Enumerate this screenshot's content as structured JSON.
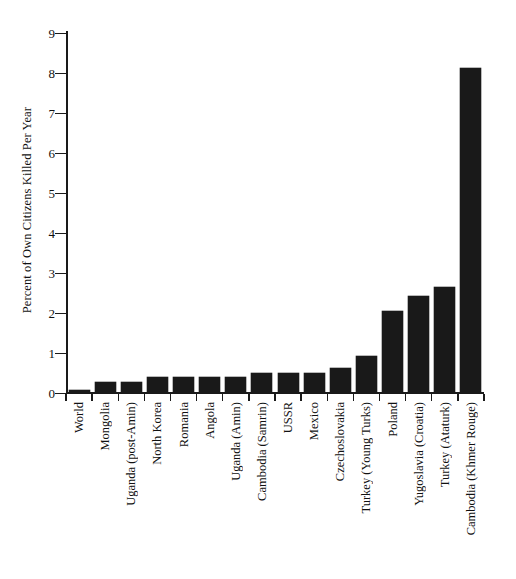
{
  "chart_data": {
    "type": "bar",
    "title": "",
    "xlabel": "",
    "ylabel": "Percent of Own Citizens Killed Per Year",
    "ylim": [
      0,
      9
    ],
    "ytick_labels": [
      "0",
      "1",
      "2",
      "3",
      "4",
      "5",
      "6",
      "7",
      "8",
      "9"
    ],
    "ytick_values": [
      0,
      1,
      2,
      3,
      4,
      5,
      6,
      7,
      8,
      9
    ],
    "grid": false,
    "legend": null,
    "bar_color": "#191919",
    "axis_color": "#1a1a1a",
    "background_color": "#ffffff",
    "categories": [
      "World",
      "Mongolia",
      "Uganda (post-Amin)",
      "North Korea",
      "Romania",
      "Angola",
      "Uganda (Amin)",
      "Cambodia (Samrin)",
      "USSR",
      "Mexico",
      "Czechoslovakia",
      "Turkey (Young Turks)",
      "Poland",
      "Yugoslavia (Croatia)",
      "Turkey (Ataturk)",
      "Cambodia (Khmer Rouge)"
    ],
    "values": [
      0.08,
      0.28,
      0.28,
      0.4,
      0.4,
      0.41,
      0.41,
      0.5,
      0.5,
      0.5,
      0.63,
      0.93,
      2.05,
      2.43,
      2.64,
      8.12
    ]
  }
}
